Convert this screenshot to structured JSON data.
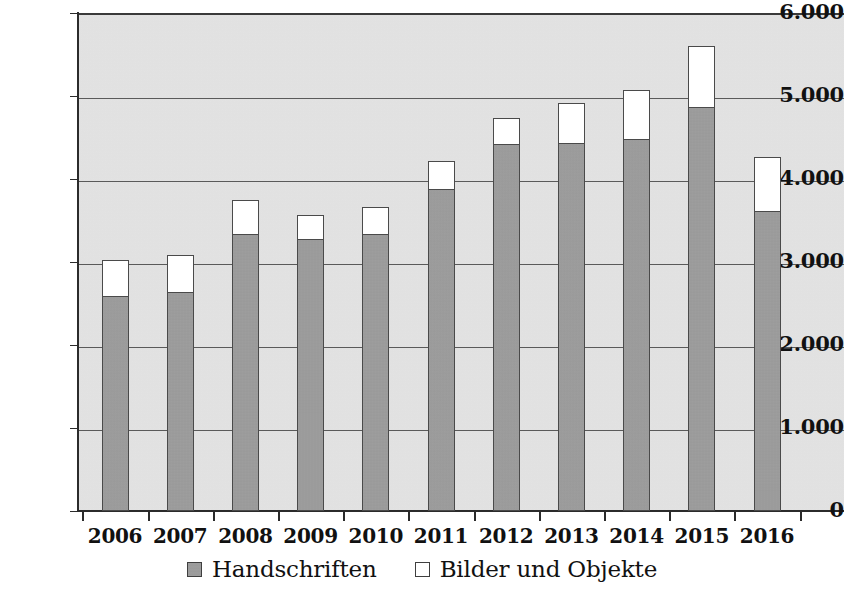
{
  "chart_data": {
    "type": "bar",
    "stacked": true,
    "title": "",
    "subtitle": "",
    "xlabel": "",
    "ylabel": "",
    "categories": [
      "2006",
      "2007",
      "2008",
      "2009",
      "2010",
      "2011",
      "2012",
      "2013",
      "2014",
      "2015",
      "2016"
    ],
    "series": [
      {
        "name": "Handschriften",
        "color": "#9c9c9c",
        "values": [
          2600,
          2640,
          3340,
          3280,
          3340,
          3890,
          4430,
          4440,
          4490,
          4880,
          3620
        ]
      },
      {
        "name": "Bilder und Objekte",
        "color": "#ffffff",
        "values": [
          430,
          440,
          410,
          290,
          320,
          330,
          310,
          470,
          580,
          720,
          640
        ]
      }
    ],
    "totals": [
      3030,
      3080,
      3750,
      3570,
      3660,
      4220,
      4740,
      4910,
      5070,
      5600,
      4260
    ],
    "ylim": [
      0,
      6000
    ],
    "ytick_values": [
      0,
      1000,
      2000,
      3000,
      4000,
      5000,
      6000
    ],
    "ytick_labels": [
      "0",
      "1.000",
      "2.000",
      "3.000",
      "4.000",
      "5.000",
      "6.000"
    ],
    "grid": true,
    "grid_axis": "y",
    "legend_position": "bottom",
    "legend": [
      {
        "label": "Handschriften",
        "swatch": "gray"
      },
      {
        "label": "Bilder und Objekte",
        "swatch": "white"
      }
    ]
  }
}
